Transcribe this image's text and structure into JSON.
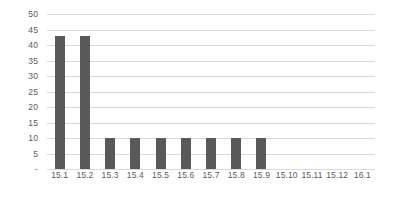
{
  "chart_data": {
    "type": "bar",
    "title": "",
    "subtitle": "",
    "xlabel": "",
    "ylabel": "",
    "categories": [
      "15.1",
      "15.2",
      "15.3",
      "15.4",
      "15.5",
      "15.6",
      "15.7",
      "15.8",
      "15.9",
      "15.10",
      "15.11",
      "15.12",
      "16.1"
    ],
    "values": [
      43,
      43,
      10,
      10,
      10,
      10,
      10,
      10,
      10,
      0,
      0,
      0,
      0
    ],
    "ylim": [
      0,
      50
    ],
    "ytick_values": [
      50,
      45,
      40,
      35,
      30,
      25,
      20,
      15,
      10,
      5,
      0
    ],
    "ytick_labels": [
      "50",
      "45",
      "40",
      "35",
      "30",
      "25",
      "20",
      "15",
      "10",
      "5",
      "-"
    ],
    "grid": true,
    "grid_axis": "y",
    "legend": false,
    "legend_position": "none",
    "bar_color": "#595959",
    "gridline_color": "#d9d9d9",
    "label_color": "#5a5a5a",
    "background_color": "#ffffff"
  }
}
